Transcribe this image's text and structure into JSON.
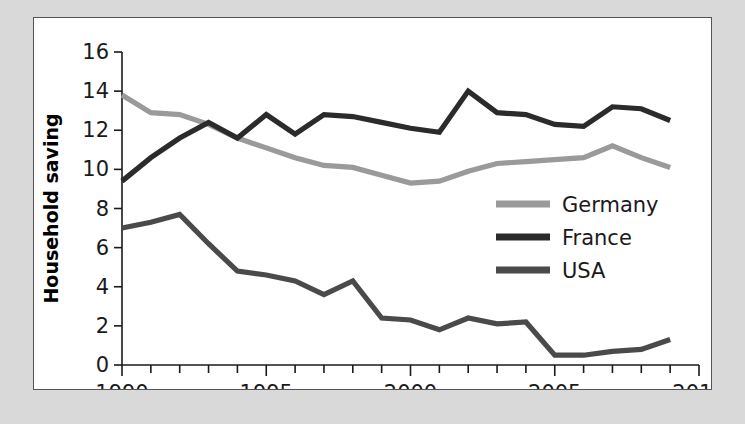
{
  "figure": {
    "panel_background": "#ffffff",
    "outer_background": "#d9d9d9",
    "border_color": "#555555"
  },
  "chart_data": {
    "type": "line",
    "title": "",
    "xlabel": "",
    "ylabel": "Household saving",
    "xlim": [
      1990,
      2010
    ],
    "ylim": [
      0,
      16
    ],
    "grid": false,
    "legend_position": "center-right",
    "x_major_ticks": [
      1990,
      1995,
      2000,
      2005,
      2010
    ],
    "x_major_tick_labels": [
      "1990",
      "1995",
      "2000",
      "2005",
      "2010"
    ],
    "x_minor_tick_step": 1,
    "y_ticks": [
      0,
      2,
      4,
      6,
      8,
      10,
      12,
      14,
      16
    ],
    "y_tick_labels": [
      "0",
      "2",
      "4",
      "6",
      "8",
      "10",
      "12",
      "14",
      "16"
    ],
    "x": [
      1990,
      1991,
      1992,
      1993,
      1994,
      1995,
      1996,
      1997,
      1998,
      1999,
      2000,
      2001,
      2002,
      2003,
      2004,
      2005,
      2006,
      2007,
      2008,
      2009
    ],
    "series": [
      {
        "name": "Germany",
        "color": "#9a9a9a",
        "values": [
          13.8,
          12.9,
          12.8,
          12.3,
          11.6,
          11.1,
          10.6,
          10.2,
          10.1,
          9.7,
          9.3,
          9.4,
          9.9,
          10.3,
          10.4,
          10.5,
          10.6,
          11.2,
          10.6,
          10.1
        ]
      },
      {
        "name": "France",
        "color": "#2b2b2b",
        "values": [
          9.4,
          10.6,
          11.6,
          12.4,
          11.6,
          12.8,
          11.8,
          12.8,
          12.7,
          12.4,
          12.1,
          11.9,
          14.0,
          12.9,
          12.8,
          12.3,
          12.2,
          13.2,
          13.1,
          12.5
        ]
      },
      {
        "name": "USA",
        "color": "#4a4a4a",
        "values": [
          7.0,
          7.3,
          7.7,
          6.2,
          4.8,
          4.6,
          4.3,
          3.6,
          4.3,
          2.4,
          2.3,
          1.8,
          2.4,
          2.1,
          2.2,
          0.5,
          0.5,
          0.7,
          0.8,
          1.3
        ]
      }
    ]
  },
  "legend": {
    "entries": [
      {
        "label": "Germany",
        "color": "#9a9a9a"
      },
      {
        "label": "France",
        "color": "#2b2b2b"
      },
      {
        "label": "USA",
        "color": "#4a4a4a"
      }
    ]
  }
}
